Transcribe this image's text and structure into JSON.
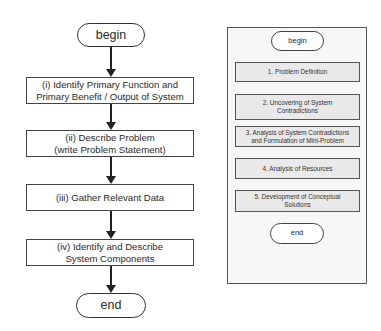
{
  "left_flowchart": {
    "begin": "begin",
    "steps": [
      {
        "line1": "(i) Identify Primary Function and",
        "line2": "Primary Benefit / Output of System"
      },
      {
        "line1": "(ii) Describe Problem",
        "line2": "(write Problem Statement)"
      },
      {
        "line1": "(iii) Gather Relevant Data",
        "line2": ""
      },
      {
        "line1": "(iv) Identify and Describe",
        "line2": "System Components"
      }
    ],
    "end": "end"
  },
  "right_flowchart": {
    "begin": "begin",
    "steps": [
      {
        "line1": "1. Problem Definition",
        "line2": ""
      },
      {
        "line1": "2. Uncovering of System",
        "line2": "Contradictions"
      },
      {
        "line1": "3. Analysis of System Contradictions",
        "line2": "and Formulation of Mini-Problem"
      },
      {
        "line1": "4. Analysis of Resources",
        "line2": ""
      },
      {
        "line1": "5. Development of Conceptual",
        "line2": "Solutions"
      }
    ],
    "end": "end"
  },
  "colors": {
    "stroke": "#333333",
    "right_box_fill": "#e9e9e9",
    "right_panel_fill": "#f7f7f7"
  }
}
